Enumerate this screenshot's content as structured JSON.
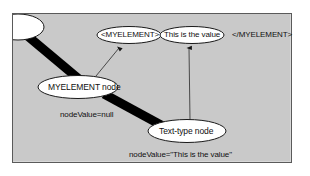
{
  "figure": {
    "background_color": "#c9c9c9",
    "frame_color": "#5a5a5a",
    "ellipse_fill": "#ffffff",
    "ellipse_stroke": "#1a1a1a",
    "connector_color": "#3a3a3a",
    "bar_color": "#000000"
  },
  "markup_row": {
    "open_tag": "<MYELEMENT>",
    "value_text": "This is the value",
    "close_tag": "</MYELEMENT>"
  },
  "nodes": {
    "element_node": "MYELEMENT node",
    "text_node": "Text-type node"
  },
  "annotations": {
    "element_node_value": "nodeValue=null",
    "text_node_value": "nodeValue=\"This is the value\""
  }
}
